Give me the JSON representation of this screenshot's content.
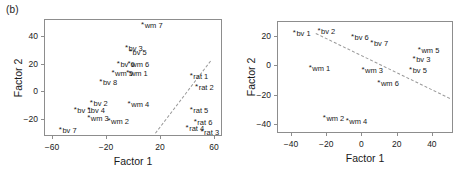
{
  "figure": {
    "panel_tag": "(b)",
    "axis_x_title": "Factor 1",
    "axis_y_title": "Factor 2"
  },
  "chart_data": [
    {
      "id": "left",
      "type": "scatter",
      "title": "(b)",
      "xlabel": "Factor 1",
      "ylabel": "Factor 2",
      "xlim": [
        -66,
        66
      ],
      "ylim": [
        -32,
        52
      ],
      "xticks": [
        -60,
        -20,
        20,
        60
      ],
      "yticks": [
        -20,
        0,
        20,
        40
      ],
      "grid": false,
      "legend": "none",
      "marker": "*",
      "annotations": [
        {
          "text": "separating dashed line",
          "type": "line",
          "style": "dashed",
          "x1": 16,
          "y1": -30,
          "x2": 57,
          "y2": 22
        }
      ],
      "points": [
        {
          "label": "wm 7",
          "x": 6,
          "y": 48
        },
        {
          "label": "bv 3",
          "x": -6,
          "y": 31
        },
        {
          "label": "bv 5",
          "x": -3,
          "y": 28
        },
        {
          "label": "bv 6",
          "x": -12,
          "y": 20
        },
        {
          "label": "wm 6",
          "x": -4,
          "y": 20
        },
        {
          "label": "wm 5",
          "x": -16,
          "y": 13
        },
        {
          "label": "wm 1",
          "x": -5,
          "y": 13
        },
        {
          "label": "bv 8",
          "x": -25,
          "y": 7
        },
        {
          "label": "rat 1",
          "x": 42,
          "y": 11
        },
        {
          "label": "rat 2",
          "x": 46,
          "y": 3
        },
        {
          "label": "bv 2",
          "x": -32,
          "y": -8
        },
        {
          "label": "wm 4",
          "x": -4,
          "y": -9
        },
        {
          "label": "bv 1",
          "x": -44,
          "y": -13
        },
        {
          "label": "bv 4",
          "x": -34,
          "y": -13
        },
        {
          "label": "rat 5",
          "x": 42,
          "y": -13
        },
        {
          "label": "wm 3",
          "x": -34,
          "y": -19
        },
        {
          "label": "wm 2",
          "x": -19,
          "y": -21
        },
        {
          "label": "rat 6",
          "x": 45,
          "y": -22
        },
        {
          "label": "rat 4",
          "x": 39,
          "y": -26
        },
        {
          "label": "bv 7",
          "x": -55,
          "y": -28
        },
        {
          "label": "rat 3",
          "x": 50,
          "y": -29
        }
      ]
    },
    {
      "id": "right",
      "type": "scatter",
      "title": "",
      "xlabel": "Factor 1",
      "ylabel": "Factor 2",
      "xlim": [
        -48,
        52
      ],
      "ylim": [
        -46,
        30
      ],
      "xticks": [
        -40,
        -20,
        0,
        20,
        40
      ],
      "yticks": [
        -40,
        -20,
        0,
        20
      ],
      "grid": false,
      "legend": "none",
      "marker": "*",
      "annotations": [
        {
          "text": "separating dashed line",
          "type": "line",
          "style": "dashed",
          "x1": -26,
          "y1": 22,
          "x2": 50,
          "y2": -22
        }
      ],
      "points": [
        {
          "label": "bv 1",
          "x": -39,
          "y": 22
        },
        {
          "label": "bv 2",
          "x": -25,
          "y": 23
        },
        {
          "label": "bv 6",
          "x": -6,
          "y": 19
        },
        {
          "label": "bv 7",
          "x": 5,
          "y": 15
        },
        {
          "label": "wm 5",
          "x": 32,
          "y": 10
        },
        {
          "label": "bv 3",
          "x": 29,
          "y": 4
        },
        {
          "label": "wm 1",
          "x": -30,
          "y": -2
        },
        {
          "label": "wm 3",
          "x": 0,
          "y": -3
        },
        {
          "label": "bv 5",
          "x": 27,
          "y": -3
        },
        {
          "label": "wm 6",
          "x": 9,
          "y": -12
        },
        {
          "label": "wm 2",
          "x": -22,
          "y": -36
        },
        {
          "label": "wm 4",
          "x": -9,
          "y": -38
        }
      ]
    }
  ]
}
